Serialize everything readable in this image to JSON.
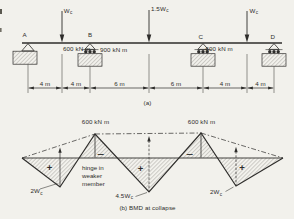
{
  "colors": {
    "background": "#f2f1ec",
    "ink": "#2e2d2b",
    "hatch": "#8e8c86"
  },
  "part_a": {
    "caption": "(a)",
    "support_labels": [
      "A",
      "B",
      "C",
      "D"
    ],
    "loads": [
      {
        "base": "W",
        "sub": "c"
      },
      {
        "base": "1.5W",
        "sub": "c"
      },
      {
        "base": "W",
        "sub": "c"
      }
    ],
    "moment_labels": [
      "600 kN m",
      "900 kN m",
      "600 kN m"
    ],
    "dim_labels": [
      "4 m",
      "4 m",
      "6 m",
      "6 m",
      "4 m",
      "4 m"
    ]
  },
  "part_b": {
    "caption": "(b) BMD at collapse",
    "peak_moment_labels": [
      "600 kN m",
      "600 kN m"
    ],
    "ordinate_labels": [
      {
        "base": "2W",
        "sub": "c"
      },
      {
        "base": "4.5W",
        "sub": "c"
      },
      {
        "base": "2W",
        "sub": "c"
      }
    ],
    "hinge_note_lines": [
      "hinge in",
      "weaker",
      "member"
    ],
    "sign_labels": [
      "+",
      "−",
      "+",
      "−",
      "+"
    ]
  }
}
